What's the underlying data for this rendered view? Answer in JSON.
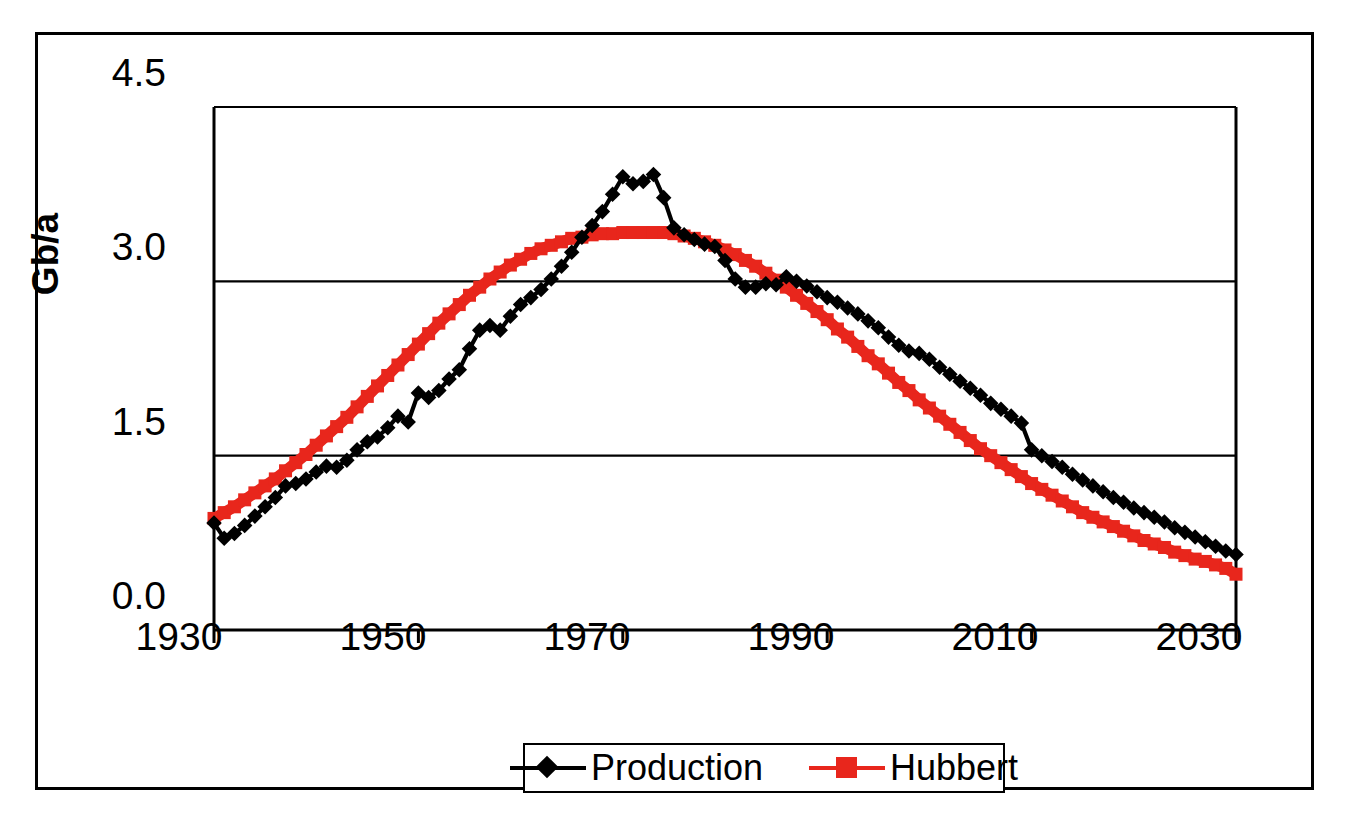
{
  "chart_data": {
    "type": "line",
    "title": "",
    "subtitle": "",
    "xlabel": "",
    "ylabel": "Gb/a",
    "xlim": [
      1930,
      2030
    ],
    "ylim": [
      0.0,
      4.5
    ],
    "xticks": [
      "1930",
      "1950",
      "1970",
      "1990",
      "2010",
      "2030"
    ],
    "xtick_values": [
      1930,
      1950,
      1970,
      1990,
      2010,
      2030
    ],
    "yticks": [
      "0.0",
      "1.5",
      "3.0",
      "4.5"
    ],
    "ytick_values": [
      0.0,
      1.5,
      3.0,
      4.5
    ],
    "grid": "horizontal",
    "legend_position": "bottom-center",
    "x": [
      1930,
      1931,
      1932,
      1933,
      1934,
      1935,
      1936,
      1937,
      1938,
      1939,
      1940,
      1941,
      1942,
      1943,
      1944,
      1945,
      1946,
      1947,
      1948,
      1949,
      1950,
      1951,
      1952,
      1953,
      1954,
      1955,
      1956,
      1957,
      1958,
      1959,
      1960,
      1961,
      1962,
      1963,
      1964,
      1965,
      1966,
      1967,
      1968,
      1969,
      1970,
      1971,
      1972,
      1973,
      1974,
      1975,
      1976,
      1977,
      1978,
      1979,
      1980,
      1981,
      1982,
      1983,
      1984,
      1985,
      1986,
      1987,
      1988,
      1989,
      1990,
      1991,
      1992,
      1993,
      1994,
      1995,
      1996,
      1997,
      1998,
      1999,
      2000,
      2001,
      2002,
      2003,
      2004,
      2005,
      2006,
      2007,
      2008,
      2009,
      2010,
      2011,
      2012,
      2013,
      2014,
      2015,
      2016,
      2017,
      2018,
      2019,
      2020,
      2021,
      2022,
      2023,
      2024,
      2025,
      2026,
      2027,
      2028,
      2029,
      2030
    ],
    "series": [
      {
        "name": "Production",
        "color": "#000000",
        "marker": "diamond",
        "values": [
          0.92,
          0.79,
          0.83,
          0.9,
          0.98,
          1.06,
          1.14,
          1.24,
          1.26,
          1.3,
          1.36,
          1.41,
          1.4,
          1.46,
          1.55,
          1.62,
          1.66,
          1.74,
          1.84,
          1.79,
          2.04,
          2.0,
          2.06,
          2.16,
          2.24,
          2.42,
          2.58,
          2.62,
          2.58,
          2.7,
          2.8,
          2.86,
          2.93,
          3.02,
          3.13,
          3.25,
          3.38,
          3.48,
          3.6,
          3.75,
          3.9,
          3.84,
          3.86,
          3.92,
          3.72,
          3.46,
          3.4,
          3.36,
          3.32,
          3.3,
          3.18,
          3.02,
          2.95,
          2.95,
          2.98,
          2.97,
          3.04,
          3.0,
          2.96,
          2.91,
          2.86,
          2.82,
          2.77,
          2.72,
          2.66,
          2.6,
          2.52,
          2.45,
          2.4,
          2.38,
          2.33,
          2.26,
          2.2,
          2.14,
          2.08,
          2.02,
          1.95,
          1.9,
          1.84,
          1.78,
          1.55,
          1.5,
          1.45,
          1.4,
          1.34,
          1.29,
          1.24,
          1.19,
          1.14,
          1.1,
          1.05,
          1.01,
          0.97,
          0.93,
          0.88,
          0.84,
          0.8,
          0.76,
          0.72,
          0.68,
          0.65
        ]
      },
      {
        "name": "Hubbert",
        "color": "#E8261C",
        "marker": "square",
        "values": [
          0.96,
          1.01,
          1.06,
          1.12,
          1.18,
          1.24,
          1.3,
          1.37,
          1.44,
          1.51,
          1.59,
          1.67,
          1.75,
          1.83,
          1.92,
          2.01,
          2.1,
          2.19,
          2.28,
          2.37,
          2.46,
          2.55,
          2.64,
          2.72,
          2.8,
          2.88,
          2.95,
          3.02,
          3.08,
          3.14,
          3.19,
          3.24,
          3.28,
          3.31,
          3.34,
          3.37,
          3.38,
          3.4,
          3.41,
          3.41,
          3.42,
          3.42,
          3.42,
          3.42,
          3.42,
          3.41,
          3.39,
          3.37,
          3.34,
          3.31,
          3.27,
          3.23,
          3.18,
          3.13,
          3.07,
          3.01,
          2.95,
          2.88,
          2.81,
          2.74,
          2.67,
          2.59,
          2.52,
          2.44,
          2.36,
          2.29,
          2.21,
          2.13,
          2.06,
          1.98,
          1.91,
          1.84,
          1.77,
          1.7,
          1.63,
          1.56,
          1.5,
          1.44,
          1.38,
          1.32,
          1.26,
          1.21,
          1.16,
          1.11,
          1.06,
          1.01,
          0.97,
          0.93,
          0.89,
          0.85,
          0.81,
          0.77,
          0.74,
          0.71,
          0.67,
          0.64,
          0.61,
          0.59,
          0.56,
          0.53,
          0.48
        ]
      }
    ]
  },
  "axis": {
    "y_label": "Gb/a",
    "y_ticks": [
      "4.5",
      "3.0",
      "1.5",
      "0.0"
    ],
    "x_ticks": [
      "1930",
      "1950",
      "1970",
      "1990",
      "2010",
      "2030"
    ]
  },
  "legend": {
    "entries": [
      {
        "label": "Production",
        "marker": "diamond-marker",
        "color": "#000000"
      },
      {
        "label": "Hubbert",
        "marker": "square-marker",
        "color": "#E8261C"
      }
    ]
  },
  "colors": {
    "production": "#000000",
    "hubbert": "#E8261C",
    "axis": "#000000",
    "background": "#ffffff"
  }
}
